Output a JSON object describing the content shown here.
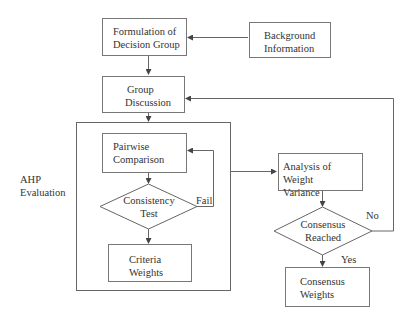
{
  "nodes": {
    "formulation": {
      "line1": "Formulation of",
      "line2": "Decision Group"
    },
    "background": {
      "line1": "Background",
      "line2": "Information"
    },
    "group_discussion": {
      "line1": "Group",
      "line2": "Discussion"
    },
    "pairwise": {
      "line1": "Pairwise",
      "line2": "Comparison"
    },
    "consistency": {
      "line1": "Consistency",
      "line2": "Test"
    },
    "criteria": {
      "line1": "Criteria",
      "line2": "Weights"
    },
    "analysis": {
      "line1": "Analysis of Weight",
      "line2": "Variance"
    },
    "consensus_reached": {
      "line1": "Consensus",
      "line2": "Reached"
    },
    "consensus_weights": {
      "line1": "Consensus",
      "line2": "Weights"
    }
  },
  "group_label": {
    "line1": "AHP",
    "line2": "Evaluation"
  },
  "edge_labels": {
    "fail": "Fail",
    "no": "No",
    "yes": "Yes"
  }
}
